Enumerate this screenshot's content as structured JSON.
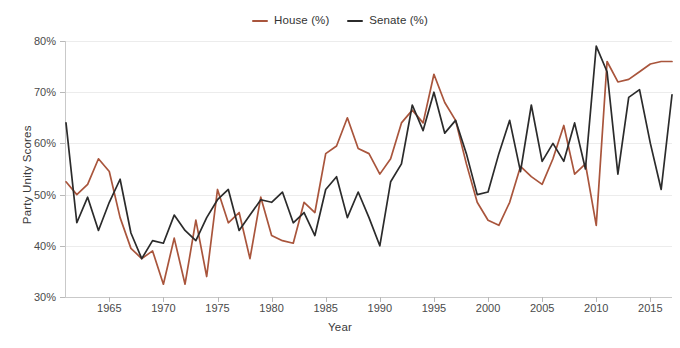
{
  "chart_data": {
    "type": "line",
    "title": "",
    "xlabel": "Year",
    "ylabel": "Party Unity Scores",
    "xlim": [
      1961,
      2017
    ],
    "ylim": [
      30,
      80
    ],
    "y_tick_labels": [
      "30%",
      "40%",
      "50%",
      "60%",
      "70%",
      "80%"
    ],
    "y_ticks": [
      30,
      40,
      50,
      60,
      70,
      80
    ],
    "x_ticks": [
      1965,
      1970,
      1975,
      1980,
      1985,
      1990,
      1995,
      2000,
      2005,
      2010,
      2015
    ],
    "x_tick_labels": [
      "1965",
      "1970",
      "1975",
      "1980",
      "1985",
      "1990",
      "1995",
      "2000",
      "2005",
      "2010",
      "2015"
    ],
    "grid": true,
    "legend_position": "top-center",
    "x": [
      1961,
      1962,
      1963,
      1964,
      1965,
      1966,
      1967,
      1968,
      1969,
      1970,
      1971,
      1972,
      1973,
      1974,
      1975,
      1976,
      1977,
      1978,
      1979,
      1980,
      1981,
      1982,
      1983,
      1984,
      1985,
      1986,
      1987,
      1988,
      1989,
      1990,
      1991,
      1992,
      1993,
      1994,
      1995,
      1996,
      1997,
      1998,
      1999,
      2000,
      2001,
      2002,
      2003,
      2004,
      2005,
      2006,
      2007,
      2008,
      2009,
      2010,
      2011,
      2012,
      2013,
      2014,
      2015,
      2016,
      2017
    ],
    "series": [
      {
        "name": "House (%)",
        "color": "#a9553c",
        "values": [
          52.5,
          50.0,
          52.0,
          57.0,
          54.5,
          45.5,
          39.5,
          37.5,
          39.0,
          32.5,
          41.5,
          32.5,
          45.0,
          34.0,
          51.0,
          44.5,
          46.5,
          37.5,
          49.5,
          42.0,
          41.0,
          40.5,
          48.5,
          46.5,
          58.0,
          59.5,
          65.0,
          59.0,
          58.0,
          54.0,
          57.0,
          64.0,
          66.5,
          64.0,
          73.5,
          68.0,
          64.5,
          56.0,
          48.5,
          45.0,
          44.0,
          48.5,
          55.5,
          53.5,
          52.0,
          57.0,
          63.5,
          54.0,
          56.0,
          44.0,
          76.0,
          72.0,
          72.5,
          74.0,
          75.5,
          76.0,
          76.0
        ]
      },
      {
        "name": "Senate (%)",
        "color": "#2b2b2b",
        "values": [
          64.0,
          44.5,
          49.5,
          43.0,
          48.5,
          53.0,
          42.5,
          37.5,
          41.0,
          40.5,
          46.0,
          43.0,
          41.0,
          45.5,
          49.0,
          51.0,
          43.0,
          46.0,
          49.0,
          48.5,
          50.5,
          44.5,
          46.5,
          42.0,
          51.0,
          53.5,
          45.5,
          50.5,
          45.5,
          40.0,
          52.5,
          56.0,
          67.5,
          62.5,
          70.0,
          62.0,
          64.5,
          58.0,
          50.0,
          50.5,
          58.0,
          64.5,
          54.5,
          67.5,
          56.5,
          60.0,
          56.5,
          64.0,
          55.0,
          79.0,
          74.0,
          54.0,
          69.0,
          70.5,
          60.0,
          51.0,
          69.5
        ]
      }
    ]
  },
  "legend": {
    "items": [
      {
        "label": "House (%)",
        "color": "#a9553c"
      },
      {
        "label": "Senate (%)",
        "color": "#2b2b2b"
      }
    ]
  },
  "axes": {
    "y_title": "Party Unity Scores",
    "x_title": "Year"
  }
}
